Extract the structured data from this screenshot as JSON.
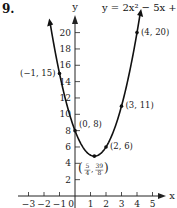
{
  "problem_number": "9.",
  "equation": "y = 2x² − 5x + 8",
  "chart_data": {
    "type": "line",
    "title": "y = 2x² − 5x + 8",
    "xlabel": "x",
    "ylabel": "y",
    "x_ticks": [
      -3,
      -2,
      -1,
      0,
      1,
      2,
      3,
      4,
      5
    ],
    "y_ticks": [
      2,
      4,
      6,
      8,
      10,
      12,
      14,
      16,
      18,
      20
    ],
    "xlim": [
      -3.5,
      5.5
    ],
    "ylim": [
      0,
      23
    ],
    "grid": false,
    "series": [
      {
        "name": "y = 2x² − 5x + 8",
        "function": "2x^2-5x+8",
        "x_range": [
          -1.6,
          4.2
        ]
      }
    ],
    "points": [
      {
        "x": -1,
        "y": 15,
        "label": "(−1, 15)"
      },
      {
        "x": 0,
        "y": 8,
        "label": "(0, 8)"
      },
      {
        "x": 1.25,
        "y": 4.875,
        "label": "(5/4, 39/8)"
      },
      {
        "x": 2,
        "y": 6,
        "label": "(2, 6)"
      },
      {
        "x": 3,
        "y": 11,
        "label": "(3, 11)"
      },
      {
        "x": 4,
        "y": 20,
        "label": "(4, 20)"
      }
    ]
  }
}
